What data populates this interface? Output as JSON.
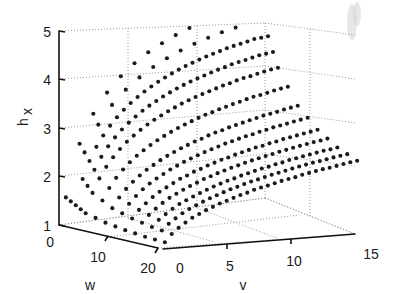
{
  "figure": {
    "background_color": "#ffffff",
    "point_color": "#1b1b1b",
    "grid_color": "#8d8d8d",
    "axis_color": "#111111",
    "marker": "filled-circle",
    "marker_size_px": 3.1
  },
  "axes": {
    "x": {
      "name": "v-axis",
      "label": "v",
      "ticks": [
        0,
        5,
        10,
        15
      ],
      "tick_labels": [
        "0",
        "5",
        "10",
        "15"
      ],
      "range": [
        0,
        15
      ]
    },
    "y": {
      "name": "w-axis",
      "label": "w",
      "ticks": [
        0,
        10,
        20
      ],
      "tick_labels": [
        "0",
        "10",
        "20"
      ],
      "range": [
        0,
        20
      ]
    },
    "z": {
      "name": "hx-axis",
      "label_base": "h",
      "label_sub": "x",
      "ticks": [
        1,
        2,
        3,
        4,
        5
      ],
      "tick_labels": [
        "1",
        "2",
        "3",
        "4",
        "5"
      ],
      "range": [
        1,
        5
      ]
    }
  },
  "chart_data": {
    "type": "scatter",
    "title": "",
    "xlabel": "v",
    "ylabel": "w",
    "zlabel": "hx",
    "xlim": [
      0,
      15
    ],
    "ylim": [
      0,
      20
    ],
    "zlim": [
      1,
      5
    ],
    "grid": true,
    "legend": null,
    "projection": "3d",
    "series": [
      {
        "name": "hx surface samples",
        "color": "#1b1b1b",
        "v_values": [
          0.5,
          1,
          1.5,
          2,
          2.5,
          3,
          3.5,
          4,
          4.5,
          5,
          5.5,
          6,
          6.5,
          7,
          7.5,
          8,
          8.5,
          9,
          9.5,
          10,
          10.5,
          11,
          11.5,
          12,
          12.5,
          13,
          13.5,
          14,
          14.5
        ],
        "w_values": [
          0,
          2,
          4,
          6,
          8,
          10,
          12,
          14,
          16,
          18,
          20
        ],
        "hx_curve_by_w": {
          "w0": [
            1.55,
            2.2,
            2.62,
            2.95,
            3.2,
            3.42,
            3.6,
            3.76,
            3.9,
            4.02,
            4.13,
            4.23,
            4.32,
            4.4,
            4.47,
            4.54,
            4.6,
            4.66,
            4.71,
            4.76,
            4.8,
            4.84,
            4.88,
            4.91,
            4.94,
            4.97,
            5.0,
            5.0,
            5.0
          ],
          "w4": [
            1.32,
            1.72,
            2.0,
            2.22,
            2.4,
            2.55,
            2.68,
            2.79,
            2.89,
            2.98,
            3.06,
            3.13,
            3.2,
            3.26,
            3.32,
            3.37,
            3.42,
            3.46,
            3.5,
            3.54,
            3.58,
            3.61,
            3.65,
            3.68,
            3.7,
            3.73,
            3.76,
            3.78,
            3.8
          ],
          "w8": [
            1.22,
            1.5,
            1.7,
            1.86,
            1.99,
            2.1,
            2.2,
            2.28,
            2.36,
            2.43,
            2.49,
            2.55,
            2.6,
            2.65,
            2.69,
            2.74,
            2.78,
            2.81,
            2.85,
            2.88,
            2.91,
            2.94,
            2.97,
            3.0,
            3.02,
            3.04,
            3.07,
            3.09,
            3.11
          ],
          "w12": [
            1.16,
            1.38,
            1.54,
            1.66,
            1.77,
            1.86,
            1.93,
            2.0,
            2.07,
            2.12,
            2.18,
            2.22,
            2.27,
            2.31,
            2.35,
            2.38,
            2.42,
            2.45,
            2.48,
            2.51,
            2.53,
            2.56,
            2.58,
            2.61,
            2.63,
            2.65,
            2.67,
            2.69,
            2.71
          ],
          "w16": [
            1.12,
            1.3,
            1.43,
            1.53,
            1.62,
            1.7,
            1.76,
            1.82,
            1.87,
            1.92,
            1.97,
            2.01,
            2.05,
            2.08,
            2.12,
            2.15,
            2.18,
            2.21,
            2.23,
            2.26,
            2.28,
            2.31,
            2.33,
            2.35,
            2.37,
            2.39,
            2.41,
            2.42,
            2.44
          ],
          "w20": [
            1.1,
            1.25,
            1.36,
            1.45,
            1.53,
            1.59,
            1.65,
            1.7,
            1.75,
            1.79,
            1.83,
            1.87,
            1.9,
            1.94,
            1.97,
            1.99,
            2.02,
            2.05,
            2.07,
            2.09,
            2.12,
            2.14,
            2.16,
            2.18,
            2.19,
            2.21,
            2.23,
            2.25,
            2.26
          ]
        }
      }
    ]
  }
}
